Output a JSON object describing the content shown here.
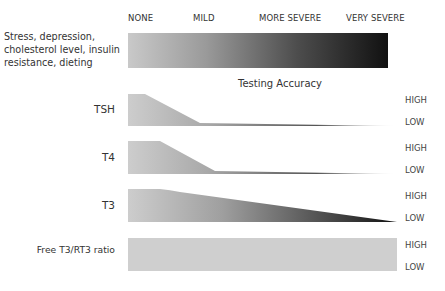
{
  "severity_scale": {
    "labels": [
      "NONE",
      "MILD",
      "MORE SEVERE",
      "VERY SEVERE"
    ],
    "factors_label": "Stress, depression, cholesterol level, insulin resistance, dieting",
    "gradient": {
      "start_color": "#c9c9c9",
      "end_color": "#111111"
    }
  },
  "section_title": "Testing Accuracy",
  "rows": [
    {
      "label": "TSH",
      "high": "HIGH",
      "low": "LOW",
      "shape": "drops sharply from high at none to low by mild, then tapers"
    },
    {
      "label": "T4",
      "high": "HIGH",
      "low": "LOW",
      "shape": "stays high slightly longer, drops to low before mild"
    },
    {
      "label": "T3",
      "high": "HIGH",
      "low": "LOW",
      "shape": "gradual linear decline from high to low across severity"
    },
    {
      "label": "Free T3/RT3 ratio",
      "high": "HIGH",
      "low": "LOW",
      "shape": "constant high accuracy across all severity"
    }
  ],
  "colors": {
    "light_gray": "#cfcfcf",
    "dark": "#111111",
    "text": "#333333"
  }
}
